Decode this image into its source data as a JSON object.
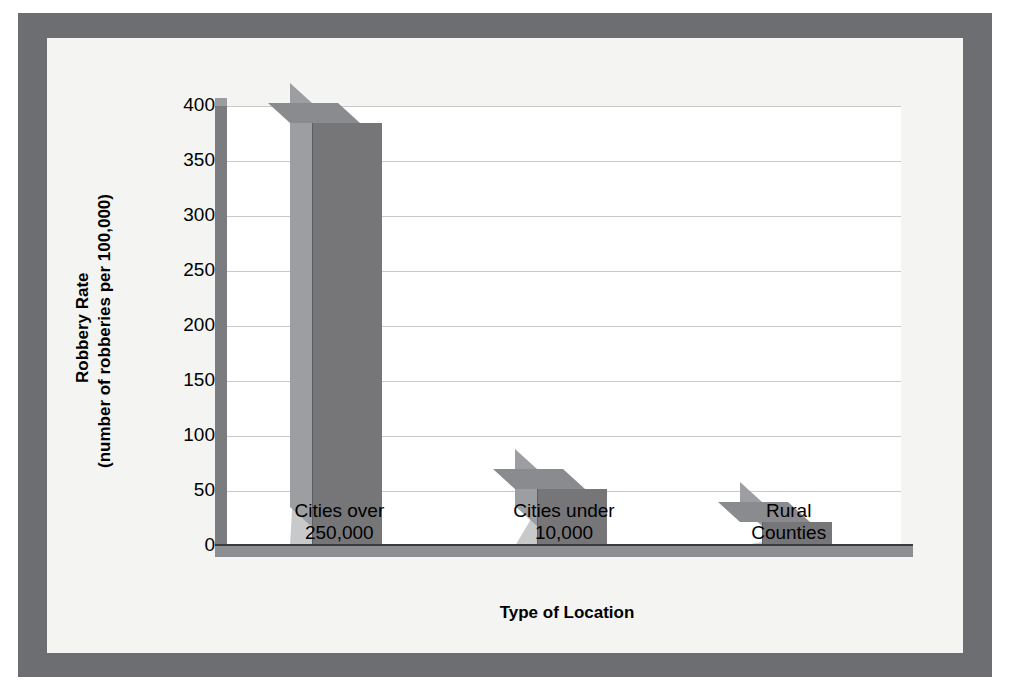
{
  "chart_data": {
    "type": "bar",
    "title": "",
    "subtitle": "",
    "xlabel": "Type of Location",
    "ylabel_line1": "Robbery Rate",
    "ylabel_line2": "(number of robberies per 100,000)",
    "categories": [
      "Cities over 250,000",
      "Cities under 10,000",
      "Rural Counties"
    ],
    "category_lines": [
      [
        "Cities over",
        "250,000"
      ],
      [
        "Cities under",
        "10,000"
      ],
      [
        "Rural",
        "Counties"
      ]
    ],
    "values": [
      385,
      52,
      22
    ],
    "ylim": [
      0,
      400
    ],
    "yticks": [
      400,
      350,
      300,
      250,
      200,
      150,
      100,
      50,
      0
    ],
    "ytick_labels": [
      "400",
      "350",
      "300",
      "250",
      "200",
      "150",
      "100",
      "50",
      "0"
    ],
    "grid": true,
    "legend": "none",
    "style": "3d-column",
    "colors": {
      "bar_front": "#767679",
      "bar_top": "#8a8b8e",
      "bar_side": "#9d9ea1",
      "bar_shadow": "#c8c9cb",
      "plot_background": "#ffffff",
      "canvas_background": "#f4f4f2",
      "frame_border": "#6d6e72",
      "gridline": "#c9c9c9",
      "axis": "#3a3b3d",
      "text": "#000000"
    }
  }
}
